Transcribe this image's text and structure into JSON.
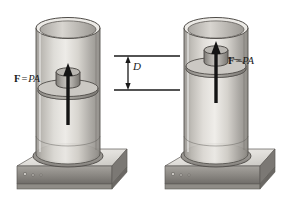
{
  "figure": {
    "background_color": "#ffffff",
    "line_color": "#1a1a1a",
    "metal_light": "#e8e6e2",
    "metal_mid": "#bdbab4",
    "metal_dark": "#8d8a85",
    "metal_shadow": "#6a6763"
  },
  "labels": {
    "force_left": {
      "bold_symbol": "F",
      "equals": "=",
      "italic_symbol": "PA",
      "full_text": "F = PA"
    },
    "force_right": {
      "bold_symbol": "F",
      "equals": "=",
      "italic_symbol": "PA",
      "full_text": "F = PA"
    },
    "dimension": {
      "symbol": "D",
      "full_text": "D"
    }
  },
  "assemblies": [
    {
      "name": "left-assembly",
      "piston_label": "F = PA",
      "piston_height_px": 85,
      "arrow_direction": "up"
    },
    {
      "name": "right-assembly",
      "piston_label": "F = PA",
      "piston_height_px": 63,
      "arrow_direction": "up"
    }
  ],
  "dimension_line": {
    "symbol": "D",
    "upper_extension_y": 56,
    "lower_extension_y": 90,
    "arrow_heads": "both"
  }
}
